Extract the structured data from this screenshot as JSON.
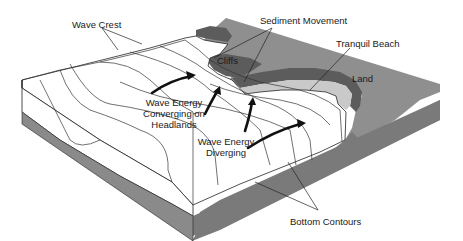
{
  "diagram": {
    "labels": {
      "wave_crest": "Wave Crest",
      "sediment_movement": "Sediment Movement",
      "cliffs": "Cliffs",
      "tranquil_beach": "Tranquil Beach",
      "land": "Land",
      "wave_energy_converging_line1": "Wave Energy",
      "wave_energy_converging_line2": "Converging on",
      "wave_energy_converging_line3": "Headlands",
      "wave_energy_diverging_line1": "Wave Energy",
      "wave_energy_diverging_line2": "Diverging",
      "bottom_contours": "Bottom Contours"
    },
    "colors": {
      "land": "#8f8f8f",
      "cliff": "#5c5c5c",
      "beach": "#c9c9c9",
      "sea": "#ffffff",
      "ink": "#1a1a1a"
    }
  }
}
